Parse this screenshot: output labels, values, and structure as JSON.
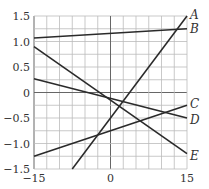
{
  "chart_data": {
    "type": "line",
    "title": "",
    "xlabel": "",
    "ylabel": "",
    "xlim": [
      -15,
      15
    ],
    "ylim": [
      -1.5,
      1.5
    ],
    "grid": true,
    "x_ticks": [
      "-15",
      "0",
      "15"
    ],
    "y_ticks": [
      "1.5",
      "1.0",
      "0.5",
      "0",
      "-0.5",
      "-1.0",
      "-1.5"
    ],
    "series": [
      {
        "name": "A",
        "x": [
          -7.5,
          15
        ],
        "values": [
          -1.5,
          1.5
        ]
      },
      {
        "name": "B",
        "x": [
          -15,
          15
        ],
        "values": [
          1.07,
          1.25
        ]
      },
      {
        "name": "C",
        "x": [
          -15,
          15
        ],
        "values": [
          -1.25,
          -0.25
        ]
      },
      {
        "name": "D",
        "x": [
          -15,
          15
        ],
        "values": [
          0.27,
          -0.5
        ]
      },
      {
        "name": "E",
        "x": [
          -15,
          15
        ],
        "values": [
          0.9,
          -1.2
        ]
      }
    ]
  },
  "labels": {
    "y": [
      "1.5",
      "1.0",
      "0.5",
      "0",
      "−0.5",
      "−1.0",
      "−1.5"
    ],
    "x": [
      "−15",
      "0",
      "15"
    ],
    "series": [
      "A",
      "B",
      "C",
      "D",
      "E"
    ]
  }
}
